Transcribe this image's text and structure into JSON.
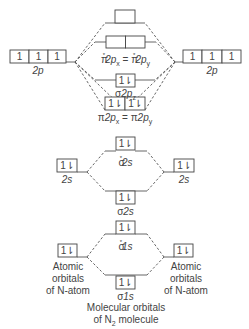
{
  "colors": {
    "line": "#555555",
    "box_border": "#444444",
    "text": "#444444",
    "background": "#ffffff"
  },
  "atomic_orbitals": {
    "left": {
      "p2": {
        "label": "2p",
        "electrons": [
          "1",
          "1",
          "1"
        ]
      },
      "s2": {
        "label": "2s",
        "electrons": [
          "1⇂"
        ]
      },
      "s1": {
        "label": "1s",
        "electrons": [
          "1⇂"
        ]
      },
      "caption": [
        "Atomic",
        "orbitals",
        "of N-atom"
      ]
    },
    "right": {
      "p2": {
        "label": "2p",
        "electrons": [
          "1",
          "1",
          "1"
        ]
      },
      "s2": {
        "label": "2s",
        "electrons": [
          "1⇂"
        ]
      },
      "s1": {
        "label": "1s",
        "electrons": [
          "1⇂"
        ]
      },
      "caption": [
        "Atomic",
        "orbitals",
        "of N-atom"
      ]
    }
  },
  "molecular_orbitals": {
    "sigma_star_2pz": {
      "label": "σ*2pz",
      "electrons": [
        ""
      ]
    },
    "pi_star_2p": {
      "label": "π*2px = π*2py",
      "electrons": [
        "",
        ""
      ]
    },
    "sigma_2pz": {
      "label": "σ2pz",
      "electrons": [
        "1⇂"
      ]
    },
    "pi_2p": {
      "label": "π2px = π2py",
      "electrons": [
        "1⇂",
        "1⇂"
      ]
    },
    "sigma_star_2s": {
      "label": "σ*2s",
      "electrons": [
        "1⇂"
      ]
    },
    "sigma_2s": {
      "label": "σ2s",
      "electrons": [
        "1⇂"
      ]
    },
    "sigma_star_1s": {
      "label": "σ*1s",
      "electrons": [
        "1⇂"
      ]
    },
    "sigma_1s": {
      "label": "σ1s",
      "electrons": [
        "1⇂"
      ]
    }
  },
  "captions": {
    "left_atomic": [
      "Atomic",
      "orbitals",
      "of N-atom"
    ],
    "right_atomic": [
      "Atomic",
      "orbitals",
      "of N-atom"
    ],
    "molecular_line1": "Molecular orbitals",
    "molecular_line2_prefix": "of N",
    "molecular_line2_sub": "2",
    "molecular_line2_suffix": " molecule"
  },
  "labels": {
    "p2_left": "2p",
    "p2_right": "2p",
    "s2_left": "2s",
    "s2_right": "2s",
    "pi_star_sym": "π",
    "pi_star_sub_x": "x",
    "pi_star_sub_y": "y",
    "pi_star_mid": "2p",
    "eq": " = ",
    "sigma_2pz_sym": "σ",
    "sigma_2pz_mid": "2p",
    "sigma_2pz_sub": "z",
    "pi_sym": "π",
    "pi_mid": "2p",
    "pi_sub_x": "x",
    "pi_sub_y": "y",
    "sigma_star_2s_sym": "σ",
    "sigma_star_2s_mid": "2s",
    "sigma_2s_sym": "σ",
    "sigma_2s_mid": "2s",
    "sigma_star_1s_sym": "σ",
    "sigma_star_1s_mid": "1s",
    "sigma_1s_sym": "σ",
    "sigma_1s_mid": "1s",
    "star": "*"
  }
}
